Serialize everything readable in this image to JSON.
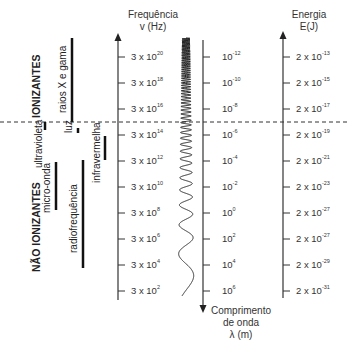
{
  "left_labels": {
    "ionizing": "IONIZANTES",
    "non_ionizing": "NÃO IONIZANTES",
    "bands": [
      {
        "name": "raios X e gama"
      },
      {
        "name": "ultravioleta"
      },
      {
        "name": "luz"
      },
      {
        "name": "infravermelha"
      },
      {
        "name": "micro-onda"
      },
      {
        "name": "radiofrequência"
      }
    ]
  },
  "frequency_axis": {
    "title_line1": "Frequência",
    "title_line2": "v (Hz)",
    "ticks": [
      {
        "base": "3 x 10",
        "exp": "20"
      },
      {
        "base": "3 x 10",
        "exp": "18"
      },
      {
        "base": "3 x 10",
        "exp": "16"
      },
      {
        "base": "3 x 10",
        "exp": "14"
      },
      {
        "base": "3 x 10",
        "exp": "12"
      },
      {
        "base": "3 x 10",
        "exp": "10"
      },
      {
        "base": "3 x 10",
        "exp": "8"
      },
      {
        "base": "3 x 10",
        "exp": "6"
      },
      {
        "base": "3 x 10",
        "exp": "4"
      },
      {
        "base": "3 x 10",
        "exp": "2"
      }
    ]
  },
  "wavelength_axis": {
    "title_line1": "Comprimento",
    "title_line2": "de onda",
    "title_line3": "λ (m)",
    "ticks": [
      {
        "base": "10",
        "exp": "-12"
      },
      {
        "base": "10",
        "exp": "-10"
      },
      {
        "base": "10",
        "exp": "-8"
      },
      {
        "base": "10",
        "exp": "-6"
      },
      {
        "base": "10",
        "exp": "-4"
      },
      {
        "base": "10",
        "exp": "-2"
      },
      {
        "base": "10",
        "exp": "0"
      },
      {
        "base": "10",
        "exp": "2"
      },
      {
        "base": "10",
        "exp": "4"
      },
      {
        "base": "10",
        "exp": "6"
      }
    ]
  },
  "energy_axis": {
    "title_line1": "Energia",
    "title_line2": "E(J)",
    "ticks": [
      {
        "base": "2 x 10",
        "exp": "-13"
      },
      {
        "base": "2 x 10",
        "exp": "-15"
      },
      {
        "base": "2 x 10",
        "exp": "-17"
      },
      {
        "base": "2 x 10",
        "exp": "-19"
      },
      {
        "base": "2 x 10",
        "exp": "-21"
      },
      {
        "base": "2 x 10",
        "exp": "-23"
      },
      {
        "base": "2 x 10",
        "exp": "-27"
      },
      {
        "base": "2 x 10",
        "exp": "-27"
      },
      {
        "base": "2 x 10",
        "exp": "-29"
      },
      {
        "base": "2 x 10",
        "exp": "-31"
      }
    ]
  },
  "divider": {
    "style": "dashed",
    "meaning": "ionizing / non-ionizing boundary"
  },
  "colors": {
    "ink": "#222222",
    "background": "#ffffff"
  }
}
